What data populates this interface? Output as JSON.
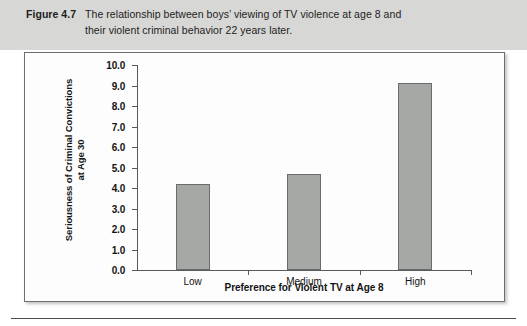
{
  "figure": {
    "number_label": "Figure 4.7",
    "caption_line1": "The relationship between boys’ viewing of TV violence at age 8 and",
    "caption_line2": "their violent criminal behavior 22 years later."
  },
  "colors": {
    "caption_band": "#d7d7d5",
    "panel_background": "#fdfdfd",
    "panel_border": "#6d6e70",
    "bar_fill": "#a6a8a6",
    "bar_border": "#6b6c6e",
    "axis_line": "#58595b",
    "text": "#141414"
  },
  "chart_data": {
    "type": "bar",
    "title": "",
    "categories": [
      "Low",
      "Medium",
      "High"
    ],
    "values": [
      4.2,
      4.7,
      9.1
    ],
    "xlabel": "Preference for Violent TV at Age 8",
    "ylabel": "Seriousness of Criminal Convictions at Age 30",
    "ylabel_line1": "Seriousness of Criminal Convictions",
    "ylabel_line2": "at Age 30",
    "ylim": [
      0.0,
      10.0
    ],
    "ytick_values": [
      0.0,
      1.0,
      2.0,
      3.0,
      4.0,
      5.0,
      6.0,
      7.0,
      8.0,
      9.0,
      10.0
    ],
    "ytick_labels": [
      "0.0",
      "1.0",
      "2.0",
      "3.0",
      "4.0",
      "5.0",
      "6.0",
      "7.0",
      "8.0",
      "9.0",
      "10.0"
    ],
    "grid": false,
    "legend": "none"
  }
}
